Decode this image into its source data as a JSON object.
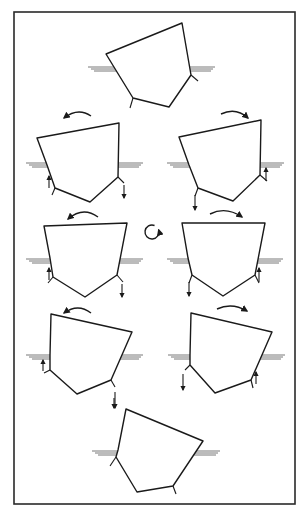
{
  "figure": {
    "title": "",
    "frame": {
      "x": 14,
      "y": 12,
      "w": 281,
      "h": 492,
      "stroke": "#2a2a2a"
    },
    "ink_color": "#1a1a1a",
    "water_color": "#555555",
    "center_rotation_icon": {
      "cx": 152,
      "cy": 232,
      "r": 7,
      "direction": "clockwise"
    },
    "hulls": [
      {
        "id": "hull-top",
        "label": "heeled to port (start)",
        "points": [
          [
            106,
            54
          ],
          [
            182,
            23
          ],
          [
            191,
            75
          ],
          [
            169,
            107
          ],
          [
            133,
            98
          ],
          [
            117,
            72
          ]
        ],
        "waterline": {
          "y": 67,
          "left_x": [
            88,
            118
          ],
          "right_x": [
            188,
            215
          ]
        },
        "strakes": [
          [
            [
              191,
              75
            ],
            [
              198,
              81
            ]
          ],
          [
            [
              133,
              98
            ],
            [
              130,
              108
            ]
          ]
        ],
        "rotation_arrow": null,
        "force_arrows": []
      },
      {
        "id": "hull-row2-left",
        "label": "rolling back",
        "points": [
          [
            37,
            138
          ],
          [
            119,
            123
          ],
          [
            118,
            177
          ],
          [
            90,
            202
          ],
          [
            55,
            188
          ],
          [
            47,
            165
          ]
        ],
        "waterline": {
          "y": 163,
          "left_x": [
            26,
            46
          ],
          "right_x": [
            118,
            143
          ]
        },
        "strakes": [
          [
            [
              118,
              177
            ],
            [
              124,
              183
            ]
          ],
          [
            [
              55,
              188
            ],
            [
              52,
              195
            ]
          ]
        ],
        "rotation_arrow": {
          "from": [
            91,
            116
          ],
          "ctrl": [
            78,
            107
          ],
          "to": [
            64,
            118
          ],
          "dir": "left"
        },
        "force_arrows": [
          {
            "x": 49,
            "y1": 188,
            "y2": 176,
            "dir": "up"
          },
          {
            "x": 124,
            "y1": 185,
            "y2": 198,
            "dir": "down"
          }
        ]
      },
      {
        "id": "hull-row2-right",
        "label": "rolling over",
        "points": [
          [
            179,
            137
          ],
          [
            261,
            120
          ],
          [
            260,
            175
          ],
          [
            233,
            201
          ],
          [
            198,
            188
          ],
          [
            189,
            165
          ]
        ],
        "waterline": {
          "y": 163,
          "left_x": [
            167,
            189
          ],
          "right_x": [
            260,
            284
          ]
        },
        "strakes": [
          [
            [
              260,
              175
            ],
            [
              267,
              181
            ]
          ],
          [
            [
              198,
              188
            ],
            [
              195,
              196
            ]
          ]
        ],
        "rotation_arrow": {
          "from": [
            221,
            114
          ],
          "ctrl": [
            236,
            107
          ],
          "to": [
            248,
            118
          ],
          "dir": "right"
        },
        "force_arrows": [
          {
            "x": 266,
            "y1": 181,
            "y2": 168,
            "dir": "up"
          },
          {
            "x": 195,
            "y1": 195,
            "y2": 210,
            "dir": "down"
          }
        ]
      },
      {
        "id": "hull-row3-left",
        "label": "upright, rolling left",
        "points": [
          [
            44,
            226
          ],
          [
            127,
            223
          ],
          [
            117,
            275
          ],
          [
            85,
            297
          ],
          [
            53,
            277
          ],
          [
            50,
            258
          ]
        ],
        "waterline": {
          "y": 259,
          "left_x": [
            26,
            50
          ],
          "right_x": [
            120,
            143
          ]
        },
        "strakes": [
          [
            [
              117,
              275
            ],
            [
              123,
              282
            ]
          ],
          [
            [
              53,
              277
            ],
            [
              48,
              283
            ]
          ]
        ],
        "rotation_arrow": {
          "from": [
            98,
            217
          ],
          "ctrl": [
            83,
            206
          ],
          "to": [
            68,
            219
          ],
          "dir": "left"
        },
        "force_arrows": [
          {
            "x": 49,
            "y1": 280,
            "y2": 268,
            "dir": "up"
          },
          {
            "x": 122,
            "y1": 284,
            "y2": 297,
            "dir": "down"
          }
        ]
      },
      {
        "id": "hull-row3-right",
        "label": "upright, rolling right",
        "points": [
          [
            182,
            223
          ],
          [
            265,
            223
          ],
          [
            255,
            275
          ],
          [
            223,
            296
          ],
          [
            192,
            275
          ],
          [
            188,
            258
          ]
        ],
        "waterline": {
          "y": 259,
          "left_x": [
            167,
            188
          ],
          "right_x": [
            258,
            283
          ]
        },
        "strakes": [
          [
            [
              255,
              275
            ],
            [
              259,
              283
            ]
          ],
          [
            [
              192,
              275
            ],
            [
              189,
              283
            ]
          ]
        ],
        "rotation_arrow": {
          "from": [
            210,
            214
          ],
          "ctrl": [
            226,
            206
          ],
          "to": [
            242,
            217
          ],
          "dir": "right"
        },
        "force_arrows": [
          {
            "x": 259,
            "y1": 282,
            "y2": 268,
            "dir": "up"
          },
          {
            "x": 189,
            "y1": 282,
            "y2": 296,
            "dir": "down"
          }
        ]
      },
      {
        "id": "hull-row4-left",
        "label": "heeled to starboard, rolling left",
        "points": [
          [
            51,
            314
          ],
          [
            132,
            332
          ],
          [
            111,
            380
          ],
          [
            77,
            394
          ],
          [
            50,
            370
          ],
          [
            50,
            355
          ]
        ],
        "waterline": {
          "y": 355,
          "left_x": [
            26,
            50
          ],
          "right_x": [
            120,
            143
          ]
        },
        "strakes": [
          [
            [
              111,
              380
            ],
            [
              115,
              387
            ]
          ],
          [
            [
              50,
              370
            ],
            [
              44,
              373
            ]
          ]
        ],
        "rotation_arrow": {
          "from": [
            91,
            313
          ],
          "ctrl": [
            78,
            303
          ],
          "to": [
            64,
            313
          ],
          "dir": "left"
        },
        "force_arrows": [
          {
            "x": 43,
            "y1": 371,
            "y2": 360,
            "dir": "up"
          },
          {
            "x": 115,
            "y1": 392,
            "y2": 408,
            "dir": "down"
          }
        ]
      },
      {
        "id": "hull-row4-right",
        "label": "heeled to starboard, rolling right",
        "points": [
          [
            191,
            313
          ],
          [
            272,
            332
          ],
          [
            251,
            380
          ],
          [
            215,
            393
          ],
          [
            190,
            365
          ],
          [
            190,
            355
          ]
        ],
        "waterline": {
          "y": 355,
          "left_x": [
            168,
            190
          ],
          "right_x": [
            262,
            285
          ]
        },
        "strakes": [
          [
            [
              251,
              380
            ],
            [
              253,
              388
            ]
          ],
          [
            [
              190,
              365
            ],
            [
              185,
              370
            ]
          ]
        ],
        "rotation_arrow": {
          "from": [
            217,
            309
          ],
          "ctrl": [
            232,
            302
          ],
          "to": [
            247,
            311
          ],
          "dir": "right"
        },
        "force_arrows": [
          {
            "x": 256,
            "y1": 384,
            "y2": 372,
            "dir": "up"
          },
          {
            "x": 183,
            "y1": 374,
            "y2": 390,
            "dir": "down"
          }
        ]
      },
      {
        "id": "hull-bottom",
        "label": "heeled to starboard (end)",
        "points": [
          [
            126,
            409
          ],
          [
            203,
            441
          ],
          [
            173,
            486
          ],
          [
            137,
            492
          ],
          [
            116,
            457
          ],
          [
            118,
            450
          ]
        ],
        "waterline": {
          "y": 451,
          "left_x": [
            92,
            117
          ],
          "right_x": [
            194,
            220
          ]
        },
        "strakes": [
          [
            [
              173,
              486
            ],
            [
              176,
              494
            ]
          ],
          [
            [
              116,
              457
            ],
            [
              110,
              466
            ]
          ]
        ],
        "rotation_arrow": null,
        "force_arrows": []
      }
    ],
    "transition_arrows": [
      {
        "x": 114,
        "y1": 398,
        "y2": 408,
        "dir": "down",
        "note": "arrow into bottom hull"
      }
    ]
  }
}
